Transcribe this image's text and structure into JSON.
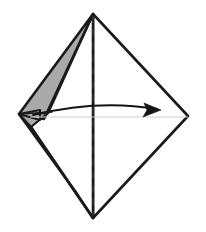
{
  "figure": {
    "title": "Origami fold step diagram",
    "caption": "",
    "canvas": {
      "width": 206,
      "height": 232,
      "background": "#ffffff"
    },
    "colors": {
      "paper_front": "#ffffff",
      "paper_back_shade": "#a9a9a9",
      "outline": "#1a1a1a",
      "crease_dashed": "#2b2b2b",
      "edge_light": "#cfcfcf",
      "arrow": "#141414"
    },
    "strokes": {
      "outline_width": 2.6,
      "inner_width": 1.6,
      "dash_width": 2.0,
      "dash_pattern": "7 6",
      "light_width": 1.0,
      "arrow_width": 2.0
    },
    "vertices": {
      "top_apex": {
        "x": 93,
        "y": 14
      },
      "bottom_apex": {
        "x": 93,
        "y": 218
      },
      "left_point": {
        "x": 19,
        "y": 114
      },
      "right_point": {
        "x": 188,
        "y": 116
      },
      "inner_fold_point": {
        "x": 48,
        "y": 113
      },
      "left_lower_notch": {
        "x": 30,
        "y": 126
      },
      "upper_gray_inner": {
        "x": 41,
        "y": 118
      }
    },
    "shapes": [
      {
        "name": "right-half-kite-white",
        "kind": "polygon",
        "fill": "#ffffff",
        "stroke": "#1a1a1a",
        "points": "93,14 188,116 93,218"
      },
      {
        "name": "left-half-kite-white",
        "kind": "polygon",
        "fill": "#ffffff",
        "stroke": "#1a1a1a",
        "points": "93,14 48,113 30,126 93,218"
      },
      {
        "name": "upper-back-flap-gray",
        "kind": "polygon",
        "fill": "#a9a9a9",
        "stroke": "#1a1a1a",
        "points": "93,14 19,114 41,118"
      },
      {
        "name": "lower-back-flap-gray",
        "kind": "polygon",
        "fill": "#a9a9a9",
        "stroke": "#1a1a1a",
        "points": "19,114 30,126 93,218 78,196"
      },
      {
        "name": "flap-tip-wedge-gray",
        "kind": "polygon",
        "fill": "#a9a9a9",
        "stroke": "#1a1a1a",
        "points": "19,114 48,113 30,126"
      }
    ],
    "lines": [
      {
        "name": "vertical-center-crease",
        "style": "dashed",
        "from": {
          "x": 93,
          "y": 16
        },
        "to": {
          "x": 93,
          "y": 216
        }
      },
      {
        "name": "horizontal-edge-light",
        "style": "light-solid",
        "from": {
          "x": 30,
          "y": 117
        },
        "to": {
          "x": 188,
          "y": 117
        }
      },
      {
        "name": "fold-edge-left-to-inner",
        "style": "thin-solid",
        "from": {
          "x": 19,
          "y": 114
        },
        "to": {
          "x": 48,
          "y": 113
        }
      }
    ],
    "arrow": {
      "name": "fold-direction-arrow",
      "label": "",
      "start": {
        "x": 33,
        "y": 115
      },
      "control": {
        "x": 98,
        "y": 99
      },
      "end": {
        "x": 159,
        "y": 110
      },
      "head_points": "159,110 146,104 148,110 145,117",
      "direction": "left-to-right",
      "meaning": "fold the flap over to the right"
    }
  }
}
